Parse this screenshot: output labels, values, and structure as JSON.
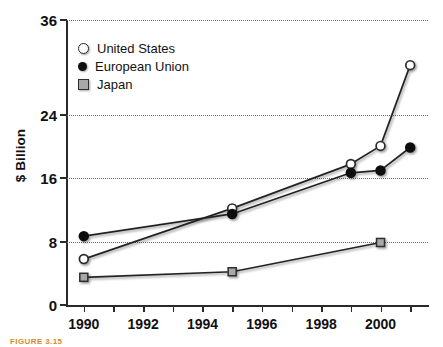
{
  "figure": {
    "caption": "FIGURE 3.15"
  },
  "chart_data": {
    "type": "line",
    "title": "",
    "xlabel": "",
    "ylabel": "$ Billion",
    "xlim": [
      1989.4,
      2001.6
    ],
    "ylim": [
      0,
      36
    ],
    "grid": true,
    "grid_axis": "y",
    "legend_position": "top-left",
    "y_ticks": [
      0,
      8,
      16,
      24,
      36
    ],
    "y_tick_labels": [
      "0",
      "8",
      "16",
      "24",
      "36"
    ],
    "x_ticks": [
      1990,
      1991,
      1992,
      1993,
      1994,
      1995,
      1996,
      1997,
      1998,
      1999,
      2000,
      2001
    ],
    "x_tick_labels": [
      "1990",
      "",
      "1992",
      "",
      "1994",
      "",
      "1996",
      "",
      "1998",
      "",
      "2000",
      ""
    ],
    "x_labeled_ticks": [
      {
        "year": 1990,
        "label": "1990"
      },
      {
        "year": 1992,
        "label": "1992"
      },
      {
        "year": 1994,
        "label": "1994"
      },
      {
        "year": 1996,
        "label": "1996"
      },
      {
        "year": 1998,
        "label": "1998"
      },
      {
        "year": 2000,
        "label": "2000"
      }
    ],
    "series": [
      {
        "name": "United States",
        "marker": "open-circle",
        "color": "#ffffff",
        "edge_color": "#2a2a2a",
        "x": [
          1990,
          1995,
          1999,
          2000,
          2001
        ],
        "values": [
          5.8,
          12.2,
          17.8,
          20.1,
          30.3
        ]
      },
      {
        "name": "European Union",
        "marker": "filled-circle",
        "color": "#111111",
        "edge_color": "#111111",
        "x": [
          1990,
          1995,
          1999,
          2000,
          2001
        ],
        "values": [
          8.7,
          11.5,
          16.7,
          17.0,
          19.9
        ]
      },
      {
        "name": "Japan",
        "marker": "filled-square",
        "color": "#a8a8a8",
        "edge_color": "#2f2f2f",
        "x": [
          1990,
          1995,
          2000
        ],
        "values": [
          3.5,
          4.2,
          7.9
        ]
      }
    ]
  },
  "legend": {
    "items": [
      {
        "label": "United States",
        "marker": "open-circle"
      },
      {
        "label": "European Union",
        "marker": "filled-circle"
      },
      {
        "label": "Japan",
        "marker": "filled-square"
      }
    ]
  }
}
